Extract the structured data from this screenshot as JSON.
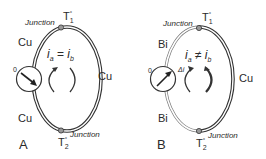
{
  "diagrams": [
    {
      "panel_label": "A",
      "top_junction": {
        "label": "Junction",
        "temp": "T",
        "temp_sub": "1",
        "temp_sup": "°"
      },
      "bottom_junction": {
        "label": "Junction",
        "temp": "T",
        "temp_sub": "2",
        "temp_sup": "°"
      },
      "wire_left_top": "Cu",
      "wire_left_bottom": "Cu",
      "wire_right": "Cu",
      "meter_zero": "0",
      "meter_delta": "",
      "current_relation": {
        "left": "i",
        "left_sub": "a",
        "op": "=",
        "right": "i",
        "right_sub": "b"
      }
    },
    {
      "panel_label": "B",
      "top_junction": {
        "label": "Junction",
        "temp": "T",
        "temp_sub": "1",
        "temp_sup": "°"
      },
      "bottom_junction": {
        "label": "Junction",
        "temp": "T",
        "temp_sub": "2",
        "temp_sup": "°"
      },
      "wire_left_top": "Bi",
      "wire_left_bottom": "Bi",
      "wire_right": "Cu",
      "meter_zero": "0",
      "meter_delta": "Δi",
      "current_relation": {
        "left": "i",
        "left_sub": "a",
        "op": "≠",
        "right": "i",
        "right_sub": "b"
      }
    }
  ],
  "colors": {
    "wire": "#333333",
    "wire_fill": "#ffffff",
    "junction": "#9a9a9a",
    "text": "#2a2a2a"
  }
}
